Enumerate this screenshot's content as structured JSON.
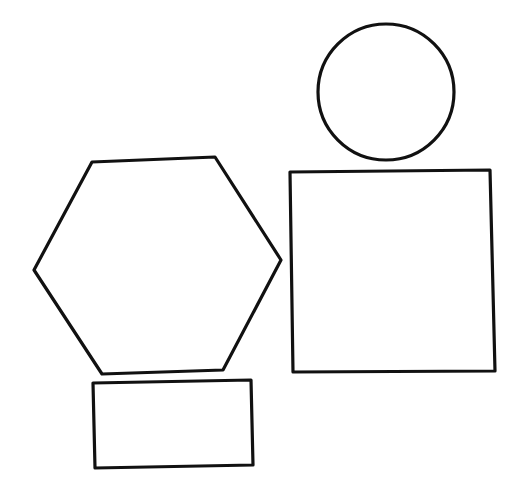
{
  "canvas": {
    "width": 522,
    "height": 491,
    "background": "#ffffff",
    "stroke": "#111111"
  },
  "shapes": {
    "circle": {
      "type": "circle",
      "cx": 386,
      "cy": 92,
      "r": 68
    },
    "square": {
      "type": "quadrilateral",
      "points": "290,172 490,170 495,371 293,372"
    },
    "hexagon": {
      "type": "hexagon",
      "points": "92,162 215,157 281,260 223,370 102,374 34,270"
    },
    "rectangle": {
      "type": "quadrilateral",
      "points": "93,383 251,380 253,465 95,468"
    }
  }
}
